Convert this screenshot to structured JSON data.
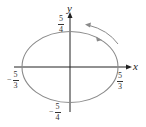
{
  "diagram": {
    "type": "parametric-ellipse",
    "center": [
      0,
      0
    ],
    "semi_axis_x": "5/3",
    "semi_axis_y": "5/4",
    "direction": "counterclockwise",
    "axes": {
      "x_label": "x",
      "y_label": "y"
    },
    "tick_labels": {
      "x_pos": {
        "num": "5",
        "den": "3",
        "sign": ""
      },
      "x_neg": {
        "num": "5",
        "den": "3",
        "sign": "−"
      },
      "y_pos": {
        "num": "5",
        "den": "4",
        "sign": ""
      },
      "y_neg": {
        "num": "5",
        "den": "4",
        "sign": "−"
      }
    },
    "colors": {
      "curve": "#8a8a8a",
      "axes": "#222222",
      "arrow": "#8a8a8a"
    }
  }
}
